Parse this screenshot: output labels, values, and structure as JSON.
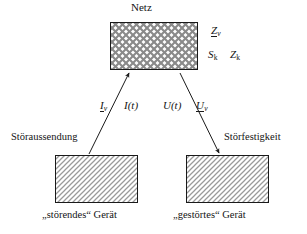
{
  "figure": {
    "width": 307,
    "height": 234,
    "background": "#ffffff",
    "line_color": "#1a1a1a",
    "text_color": "#141414"
  },
  "boxes": {
    "network": {
      "title": "Netz",
      "fill_pattern": "cross-hatch",
      "x": 110,
      "y": 22,
      "w": 88,
      "h": 48
    },
    "emitter": {
      "caption": "„störendes“ Gerät",
      "side_label": "Störaussendung",
      "fill_pattern": "diagonal-hatch",
      "x": 55,
      "y": 155,
      "w": 83,
      "h": 48
    },
    "victim": {
      "caption": "„gestörtes“ Gerät",
      "side_label": "Störfestigkeit",
      "fill_pattern": "diagonal-hatch",
      "x": 186,
      "y": 155,
      "w": 83,
      "h": 48
    }
  },
  "arrows": {
    "emission": {
      "direction": "up",
      "from": "emitter",
      "to": "network",
      "label_left": "I",
      "label_left_sub": "v",
      "label_left_underlined": true,
      "label_right": "I(t)"
    },
    "immunity": {
      "direction": "down",
      "from": "network",
      "to": "victim",
      "label_left": "U(t)",
      "label_right": "U",
      "label_right_sub": "v",
      "label_right_underlined": true
    }
  },
  "network_symbols": {
    "impedance_v": {
      "letter": "Z",
      "sub": "v",
      "underlined": true
    },
    "short_circuit_power": {
      "letter": "S",
      "sub": "k",
      "underlined": false
    },
    "short_circuit_impedance": {
      "letter": "Z",
      "sub": "k",
      "underlined": false
    }
  }
}
